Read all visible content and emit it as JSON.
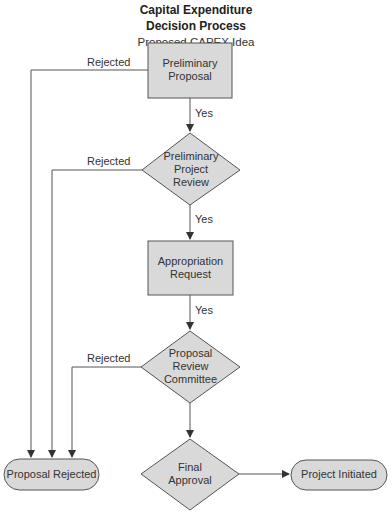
{
  "diagram": {
    "title_line1": "Capital Expenditure",
    "title_line2": "Decision Process",
    "start_label": "Proposed CAPEX Idea",
    "nodes": {
      "preliminary_proposal": {
        "line1": "Preliminary",
        "line2": "Proposal",
        "shape": "rectangle"
      },
      "preliminary_project_review": {
        "line1": "Preliminary",
        "line2": "Project",
        "line3": "Review",
        "shape": "diamond"
      },
      "appropriation_request": {
        "line1": "Appropriation",
        "line2": "Request",
        "shape": "rectangle"
      },
      "proposal_review_committee": {
        "line1": "Proposal",
        "line2": "Review",
        "line3": "Committee",
        "shape": "diamond"
      },
      "final_approval": {
        "line1": "Final",
        "line2": "Approval",
        "shape": "diamond"
      },
      "proposal_rejected": {
        "label": "Proposal Rejected",
        "shape": "terminal"
      },
      "project_initiated": {
        "label": "Project Initiated",
        "shape": "terminal"
      }
    },
    "edges": {
      "yes_1": "Yes",
      "yes_2": "Yes",
      "yes_3": "Yes",
      "rejected_1": "Rejected",
      "rejected_2": "Rejected",
      "rejected_3": "Rejected"
    },
    "colors": {
      "node_fill": "#d9d9d9",
      "node_stroke": "#555555",
      "line": "#555555"
    }
  }
}
